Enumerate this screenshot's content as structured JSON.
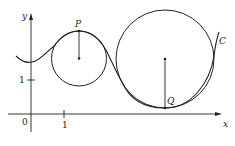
{
  "diagram": {
    "axes": {
      "x_label": "x",
      "y_label": "y",
      "origin_label": "0",
      "x_tick_label": "1",
      "y_tick_label": "1"
    },
    "points": {
      "P": "P",
      "Q": "Q"
    },
    "curve_label": "C"
  }
}
